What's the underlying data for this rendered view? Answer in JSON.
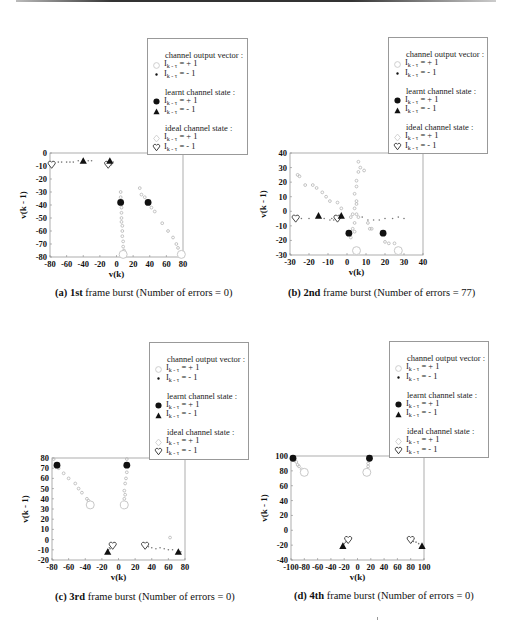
{
  "legend": {
    "groups": [
      {
        "title": "channel output vector :",
        "items": [
          {
            "symbol": "open-circle",
            "label_base": "I",
            "label_sub": "k - τ",
            "label_rest": " = + 1"
          },
          {
            "symbol": "small-dot",
            "label_base": "I",
            "label_sub": "k - τ",
            "label_rest": " = - 1"
          }
        ]
      },
      {
        "title": "learnt channel state :",
        "items": [
          {
            "symbol": "filled-circle",
            "label_base": "I",
            "label_sub": "k - τ",
            "label_rest": " = + 1"
          },
          {
            "symbol": "filled-triangle",
            "label_base": "I",
            "label_sub": "k - τ",
            "label_rest": " = - 1"
          }
        ]
      },
      {
        "title": "ideal channel state :",
        "items": [
          {
            "symbol": "open-diamond",
            "label_base": "I",
            "label_sub": "k - τ",
            "label_rest": " = + 1"
          },
          {
            "symbol": "open-heart",
            "label_base": "I",
            "label_sub": "k - τ",
            "label_rest": " = - 1"
          }
        ]
      }
    ]
  },
  "colors": {
    "frame": "#9a9a9a",
    "cloud": "#b5b5b5",
    "marker": "#111111",
    "ideal": "#c8c8c8"
  },
  "chart_data": [
    {
      "type": "scatter",
      "panel": "a",
      "caption_prefix": "(a) ",
      "caption_bold": "1st",
      "caption_rest": " frame burst (Number of errors = 0)",
      "xlabel": "v(k)",
      "ylabel": "v(k - 1)",
      "xlim": [
        -80,
        80
      ],
      "ylim": [
        -80,
        0
      ],
      "xticks": [
        -80,
        -60,
        -40,
        -20,
        0,
        20,
        40,
        60,
        80
      ],
      "yticks": [
        0,
        -10,
        -20,
        -30,
        -40,
        -50,
        -60,
        -70,
        -80
      ],
      "grid": false,
      "legend_position": "upper right (outside)",
      "learnt_plus": [
        [
          5,
          -38
        ],
        [
          38,
          -38
        ]
      ],
      "learnt_minus": [
        [
          -40,
          -6
        ],
        [
          -8,
          -6
        ]
      ],
      "ideal_plus": [
        [
          8,
          -78
        ],
        [
          78,
          -78
        ]
      ],
      "ideal_minus": [
        [
          -78,
          -9
        ],
        [
          -10,
          -9
        ]
      ],
      "output_plus": [
        [
          5,
          -30
        ],
        [
          5,
          -34
        ],
        [
          6,
          -42
        ],
        [
          6,
          -46
        ],
        [
          6,
          -50
        ],
        [
          6,
          -53
        ],
        [
          7,
          -56
        ],
        [
          7,
          -60
        ],
        [
          7,
          -64
        ],
        [
          8,
          -68
        ],
        [
          8,
          -72
        ],
        [
          9,
          -75
        ],
        [
          28,
          -27
        ],
        [
          30,
          -32
        ],
        [
          34,
          -34
        ],
        [
          42,
          -42
        ],
        [
          46,
          -45
        ],
        [
          55,
          -54
        ],
        [
          62,
          -60
        ],
        [
          68,
          -65
        ],
        [
          72,
          -70
        ],
        [
          74,
          -73
        ]
      ],
      "output_minus": [
        [
          -70,
          -7
        ],
        [
          -66,
          -7
        ],
        [
          -60,
          -7
        ],
        [
          -56,
          -7
        ],
        [
          -52,
          -7
        ],
        [
          -46,
          -6
        ],
        [
          -34,
          -6
        ],
        [
          -30,
          -6
        ],
        [
          -4,
          -7
        ],
        [
          -6,
          -9
        ]
      ]
    },
    {
      "type": "scatter",
      "panel": "b",
      "caption_prefix": "(b) ",
      "caption_bold": "2nd",
      "caption_rest": " frame burst (Number of errors = 77)",
      "xlabel": "v(k)",
      "ylabel": "v(k - 1)",
      "xlim": [
        -30,
        40
      ],
      "ylim": [
        -30,
        40
      ],
      "xticks": [
        -30,
        -20,
        -10,
        0,
        10,
        20,
        30,
        40
      ],
      "yticks": [
        40,
        30,
        20,
        10,
        0,
        -10,
        -20,
        -30
      ],
      "grid": false,
      "legend_position": "upper right (outside)",
      "learnt_plus": [
        [
          1,
          -15
        ],
        [
          19,
          -15
        ]
      ],
      "learnt_minus": [
        [
          -15,
          -3
        ],
        [
          -3,
          -3
        ]
      ],
      "ideal_plus": [
        [
          5,
          -27
        ],
        [
          27,
          -27
        ]
      ],
      "ideal_minus": [
        [
          -27,
          -5
        ],
        [
          -5,
          -5
        ]
      ],
      "output_plus": [
        [
          -26,
          25
        ],
        [
          -25,
          24
        ],
        [
          -22,
          18
        ],
        [
          -18,
          18
        ],
        [
          -16,
          16
        ],
        [
          -13,
          13
        ],
        [
          -11,
          10
        ],
        [
          -9,
          7
        ],
        [
          -5,
          6
        ],
        [
          -3,
          2
        ],
        [
          6,
          34
        ],
        [
          7,
          30
        ],
        [
          9,
          28
        ],
        [
          6,
          27
        ],
        [
          5,
          21
        ],
        [
          5,
          17
        ],
        [
          4,
          12
        ],
        [
          5,
          7
        ],
        [
          5,
          5
        ],
        [
          4,
          2
        ],
        [
          3,
          -2
        ],
        [
          2,
          -4
        ],
        [
          5,
          -2
        ],
        [
          6,
          -4
        ],
        [
          4,
          -8
        ],
        [
          3,
          -12
        ],
        [
          4,
          -14
        ],
        [
          2,
          -18
        ],
        [
          11,
          -8
        ],
        [
          12,
          -12
        ],
        [
          13,
          -12
        ],
        [
          20,
          -21
        ],
        [
          22,
          -22
        ],
        [
          25,
          -22
        ]
      ],
      "output_minus": [
        [
          -24,
          -5
        ],
        [
          -20,
          -5
        ],
        [
          -12,
          -5
        ],
        [
          -9,
          -6
        ],
        [
          -8,
          -5
        ],
        [
          -7,
          -6
        ],
        [
          8,
          -4
        ],
        [
          11,
          -6
        ],
        [
          14,
          -6
        ],
        [
          17,
          -6
        ],
        [
          20,
          -5
        ],
        [
          24,
          -5
        ],
        [
          27,
          -4
        ],
        [
          30,
          -5
        ]
      ]
    },
    {
      "type": "scatter",
      "panel": "c",
      "caption_prefix": "(c) ",
      "caption_bold": "3rd",
      "caption_rest": " frame burst (Number of errors = 0)",
      "xlabel": "v(k)",
      "ylabel": "v(k - 1)",
      "xlim": [
        -80,
        80
      ],
      "ylim": [
        -20,
        80
      ],
      "xticks": [
        -80,
        -60,
        -40,
        -20,
        0,
        20,
        40,
        60,
        80
      ],
      "yticks": [
        80,
        70,
        60,
        50,
        40,
        30,
        20,
        10,
        0,
        -10,
        -20
      ],
      "grid": false,
      "legend_position": "upper right (outside)",
      "learnt_plus": [
        [
          -74,
          73
        ],
        [
          10,
          73
        ]
      ],
      "learnt_minus": [
        [
          -13,
          -12
        ],
        [
          72,
          -12
        ]
      ],
      "ideal_plus": [
        [
          -34,
          34
        ],
        [
          7,
          34
        ]
      ],
      "ideal_minus": [
        [
          -7,
          -6
        ],
        [
          32,
          -6
        ]
      ],
      "output_plus": [
        [
          -78,
          79
        ],
        [
          -72,
          70
        ],
        [
          -66,
          65
        ],
        [
          -60,
          60
        ],
        [
          -52,
          55
        ],
        [
          -48,
          50
        ],
        [
          -44,
          46
        ],
        [
          -38,
          40
        ],
        [
          -36,
          38
        ],
        [
          10,
          79
        ],
        [
          10,
          66
        ],
        [
          9,
          60
        ],
        [
          8,
          55
        ],
        [
          7,
          48
        ],
        [
          8,
          44
        ],
        [
          7,
          40
        ],
        [
          62,
          2
        ]
      ],
      "output_minus": [
        [
          -10,
          -9
        ],
        [
          -12,
          -10
        ],
        [
          -11,
          -8
        ],
        [
          36,
          -7
        ],
        [
          40,
          -8
        ],
        [
          45,
          -9
        ],
        [
          50,
          -8
        ],
        [
          55,
          -9
        ],
        [
          60,
          -10
        ],
        [
          65,
          -10
        ],
        [
          75,
          -12
        ]
      ]
    },
    {
      "type": "scatter",
      "panel": "d",
      "caption_prefix": "(d) ",
      "caption_bold": "4th",
      "caption_rest": " frame burst (Number of errors = 0)",
      "xlabel": "v(k)",
      "ylabel": "v(k - 1)",
      "xlim": [
        -100,
        100
      ],
      "ylim": [
        -40,
        100
      ],
      "xticks": [
        -100,
        -80,
        -60,
        -40,
        -20,
        0,
        20,
        40,
        60,
        80,
        100
      ],
      "yticks": [
        100,
        80,
        60,
        40,
        20,
        0,
        -20,
        -40
      ],
      "grid": false,
      "legend_position": "upper right (outside)",
      "learnt_plus": [
        [
          -97,
          97
        ],
        [
          18,
          97
        ]
      ],
      "learnt_minus": [
        [
          -22,
          -21
        ],
        [
          97,
          -21
        ]
      ],
      "ideal_plus": [
        [
          -80,
          78
        ],
        [
          14,
          78
        ]
      ],
      "ideal_minus": [
        [
          -14,
          -13
        ],
        [
          80,
          -13
        ]
      ],
      "output_plus": [
        [
          -95,
          95
        ],
        [
          -92,
          92
        ],
        [
          -90,
          88
        ],
        [
          -88,
          86
        ],
        [
          -84,
          82
        ],
        [
          17,
          94
        ],
        [
          16,
          90
        ],
        [
          16,
          86
        ],
        [
          15,
          82
        ]
      ],
      "output_minus": [
        [
          -20,
          -18
        ],
        [
          -18,
          -16
        ],
        [
          -16,
          -14
        ],
        [
          84,
          -15
        ],
        [
          88,
          -16
        ],
        [
          92,
          -18
        ]
      ]
    }
  ]
}
